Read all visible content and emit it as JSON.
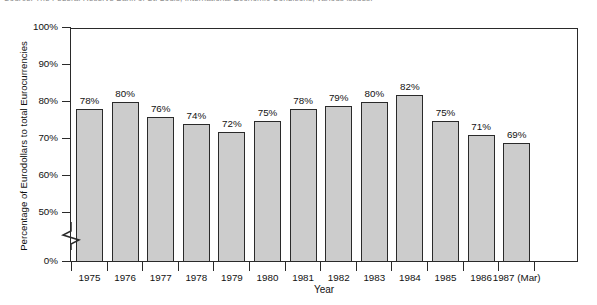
{
  "source_note": "Source: The Federal Reserve Bank of St. Louis, International Economic Conditions, various issues.",
  "chart_data": {
    "type": "bar",
    "title": "",
    "subtitle": "",
    "xlabel": "Year",
    "ylabel": "Percentage of Eurodollars to total Eurocurrencies",
    "categories": [
      "1975",
      "1976",
      "1977",
      "1978",
      "1979",
      "1980",
      "1981",
      "1982",
      "1983",
      "1984",
      "1985",
      "1986",
      "1987 (Mar)"
    ],
    "values": [
      78,
      80,
      76,
      74,
      72,
      75,
      78,
      79,
      80,
      82,
      75,
      71,
      69
    ],
    "value_labels": [
      "78%",
      "80%",
      "76%",
      "74%",
      "72%",
      "75%",
      "78%",
      "79%",
      "80%",
      "82%",
      "75%",
      "71%",
      "69%"
    ],
    "ytick_labels": [
      "100%",
      "90%",
      "80%",
      "70%",
      "60%",
      "50%",
      "0%"
    ],
    "ytick_values": [
      100,
      90,
      80,
      70,
      60,
      50,
      0
    ],
    "ylim": [
      50,
      100
    ],
    "axis_break": true,
    "grid": false,
    "legend": "none",
    "bar_fill_color": "#cccccc",
    "bar_border_color": "#2a2a2a",
    "axis_color": "#2a2a2a",
    "background_color": "#ffffff"
  }
}
